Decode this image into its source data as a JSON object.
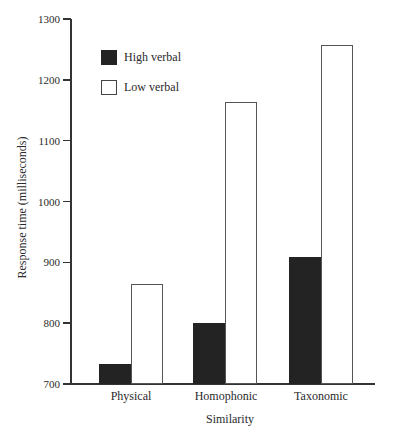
{
  "chart_data": {
    "type": "bar",
    "title": "",
    "xlabel": "Similarity",
    "ylabel": "Response time (milliseconds)",
    "categories": [
      "Physical",
      "Homophonic",
      "Taxonomic"
    ],
    "series": [
      {
        "name": "High verbal",
        "color": "#232323",
        "values": [
          733,
          800,
          909
        ]
      },
      {
        "name": "Low verbal",
        "color": "#ffffff",
        "values": [
          865,
          1163,
          1258
        ]
      }
    ],
    "ylim": [
      700,
      1300
    ],
    "yticks": [
      700,
      800,
      900,
      1000,
      1100,
      1200,
      1300
    ],
    "grid": false,
    "legend_position": "upper left (inside plot)"
  },
  "axis": {
    "ytick_labels": [
      "1300",
      "1200",
      "1100",
      "1000",
      "900",
      "800",
      "700"
    ]
  }
}
